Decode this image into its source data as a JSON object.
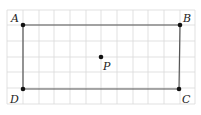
{
  "diagram": {
    "grid": {
      "x_lines": [
        7,
        23,
        39,
        54,
        70,
        86,
        101,
        117,
        133,
        148,
        164,
        180,
        195
      ],
      "y_lines": [
        10,
        25,
        41,
        57,
        72,
        88,
        104
      ],
      "color": "#d9d9d9"
    },
    "rectangle": {
      "vertices": [
        "A",
        "B",
        "C",
        "D"
      ],
      "stroke": "#555555"
    },
    "points": [
      {
        "name": "A",
        "label": "A",
        "x": 23,
        "y": 25,
        "lx": 11,
        "ly": 22
      },
      {
        "name": "B",
        "label": "B",
        "x": 180,
        "y": 25,
        "lx": 183,
        "ly": 22
      },
      {
        "name": "C",
        "label": "C",
        "x": 179,
        "y": 89,
        "lx": 182,
        "ly": 103
      },
      {
        "name": "D",
        "label": "D",
        "x": 23,
        "y": 89,
        "lx": 10,
        "ly": 103
      },
      {
        "name": "P",
        "label": "P",
        "x": 101,
        "y": 57,
        "lx": 103,
        "ly": 70
      }
    ]
  }
}
